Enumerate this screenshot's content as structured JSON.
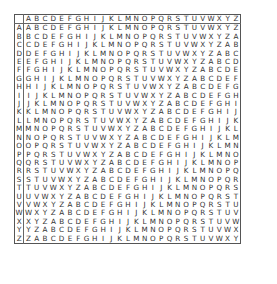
{
  "alphabet": [
    "A",
    "B",
    "C",
    "D",
    "E",
    "F",
    "G",
    "H",
    "I",
    "J",
    "K",
    "L",
    "M",
    "N",
    "O",
    "P",
    "Q",
    "R",
    "S",
    "T",
    "U",
    "V",
    "W",
    "X",
    "Y",
    "Z"
  ],
  "header_row": {
    "corner": "",
    "letters": [
      "A",
      "B",
      "C",
      "D",
      "E",
      "F",
      "G",
      "H",
      "I",
      "J",
      "K",
      "L",
      "M",
      "N",
      "O",
      "P",
      "Q",
      "R",
      "S",
      "T",
      "U",
      "V",
      "W",
      "X",
      "Y",
      "Z"
    ]
  },
  "rows": [
    {
      "key": "A",
      "cells": "ABCDEFGHIJKLMNOPQRSTUVWXYZ"
    },
    {
      "key": "B",
      "cells": "BCDEFGHIJKLMNOPQRSTUVWXYZA"
    },
    {
      "key": "C",
      "cells": "CDEFGHIJKLMNOPQRSTUVWXYZAB"
    },
    {
      "key": "D",
      "cells": "DEFGHIJKLMNOPQRSTUVWXYZABC"
    },
    {
      "key": "E",
      "cells": "EFGHIJKLMNOPQRSTUVWXYZABCD"
    },
    {
      "key": "F",
      "cells": "FGHIJKLMNOPQRSTUVWXYZABCDE"
    },
    {
      "key": "G",
      "cells": "GHIJKLMNOPQRSTUVWXYZABCDEF"
    },
    {
      "key": "H",
      "cells": "HIJKLMNOPQRSTUVWXYZABCDEFG"
    },
    {
      "key": "I",
      "cells": "IJKLMNOPQRSTUVWXYZABCDEFGH"
    },
    {
      "key": "J",
      "cells": "JKLMNOPQRSTUVWXYZABCDEFGHI"
    },
    {
      "key": "K",
      "cells": "KLMNOPQRSTUVWXYZABCDEFGHIJ"
    },
    {
      "key": "L",
      "cells": "LMNOPQRSTUVWXYZABCDEFGHIJK"
    },
    {
      "key": "M",
      "cells": "MNOPQRSTUVWXYZABCDEFGHIJKL"
    },
    {
      "key": "N",
      "cells": "NOPQRSTUVWXYZABCDEFGHIJKLM"
    },
    {
      "key": "O",
      "cells": "OPQRSTUVWXYZABCDEFGHIJKLMN"
    },
    {
      "key": "P",
      "cells": "PQRSTUVWXYZABCDEFGHIJKLMNO"
    },
    {
      "key": "Q",
      "cells": "QRSTUVWXYZABCDEFGHIJKLMNOP"
    },
    {
      "key": "R",
      "cells": "RSTUVWXYZABCDEFGHIJKLMNOPQ"
    },
    {
      "key": "S",
      "cells": "STUVWXYZABCDEFGHIJKLMNOPQR"
    },
    {
      "key": "T",
      "cells": "TUVWXYZABCDEFGHIJKLMNOPQRS"
    },
    {
      "key": "U",
      "cells": "UVWXYZABCDEFGHIJKLMNOPQRST"
    },
    {
      "key": "V",
      "cells": "VWXYZABCDEFGHIJKLMNOPQRSTU"
    },
    {
      "key": "W",
      "cells": "WXYZABCDEFGHIJKLMNOPQRSTUV"
    },
    {
      "key": "X",
      "cells": "XYZABCDEFGHIJKLMNOPQRSTUVW"
    },
    {
      "key": "Y",
      "cells": "YZABCDEFGHIJKLMNOPQRSTUVWX"
    },
    {
      "key": "Z",
      "cells": "ZABCDEFGHIJKLMNOPQRSTUVWXY"
    }
  ]
}
